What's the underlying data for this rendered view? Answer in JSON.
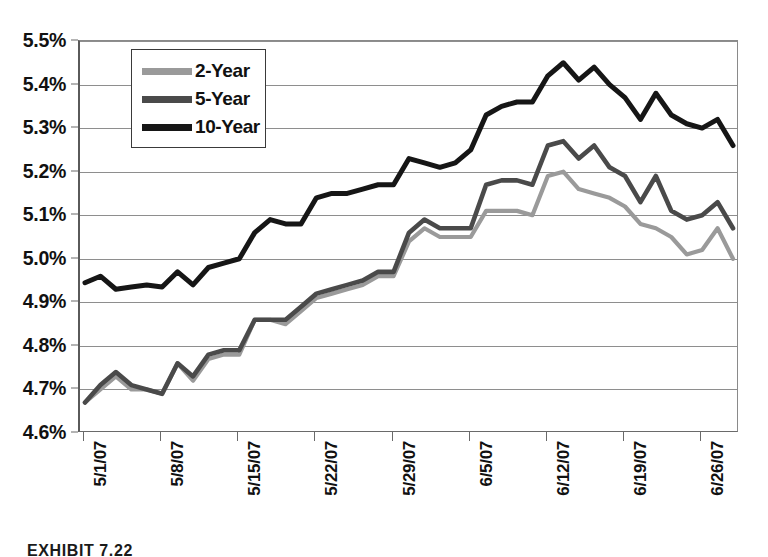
{
  "caption": "EXHIBIT 7.22",
  "colors": {
    "two_year": "#9a9a9a",
    "five_year": "#4a4a4a",
    "ten_year": "#161616",
    "gridline": "#8e8e8e",
    "axis": "#6a6a6a",
    "background": "#ffffff"
  },
  "legend": {
    "position": "inside-top-left",
    "items": [
      {
        "label": "2-Year",
        "color": "#9a9a9a"
      },
      {
        "label": "5-Year",
        "color": "#4a4a4a"
      },
      {
        "label": "10-Year",
        "color": "#161616"
      }
    ]
  },
  "chart_data": {
    "type": "line",
    "title": "",
    "subtitle": "",
    "xlabel": "",
    "ylabel": "",
    "grid": true,
    "ylim": [
      4.6,
      5.5
    ],
    "ytick_labels": [
      "5.5%",
      "5.4%",
      "5.3%",
      "5.2%",
      "5.1%",
      "5.0%",
      "4.9%",
      "4.8%",
      "4.7%",
      "4.6%"
    ],
    "ytick_values": [
      5.5,
      5.4,
      5.3,
      5.2,
      5.1,
      5.0,
      4.9,
      4.8,
      4.7,
      4.6
    ],
    "xtick_labels": [
      "5/1/07",
      "5/8/07",
      "5/15/07",
      "5/22/07",
      "5/29/07",
      "6/5/07",
      "6/12/07",
      "6/19/07",
      "6/26/07"
    ],
    "xtick_indices": [
      0,
      5,
      10,
      15,
      20,
      25,
      30,
      35,
      40
    ],
    "x": [
      0,
      1,
      2,
      3,
      4,
      5,
      6,
      7,
      8,
      9,
      10,
      11,
      12,
      13,
      14,
      15,
      16,
      17,
      18,
      19,
      20,
      21,
      22,
      23,
      24,
      25,
      26,
      27,
      28,
      29,
      30,
      31,
      32,
      33,
      34,
      35,
      36,
      37,
      38,
      39,
      40,
      41,
      42
    ],
    "series": [
      {
        "name": "2-Year",
        "color": "#9a9a9a",
        "values": [
          4.67,
          4.7,
          4.73,
          4.7,
          4.7,
          4.69,
          4.76,
          4.72,
          4.77,
          4.78,
          4.78,
          4.86,
          4.86,
          4.85,
          4.88,
          4.91,
          4.92,
          4.93,
          4.94,
          4.96,
          4.96,
          5.04,
          5.07,
          5.05,
          5.05,
          5.05,
          5.11,
          5.11,
          5.11,
          5.1,
          5.19,
          5.2,
          5.16,
          5.15,
          5.14,
          5.12,
          5.08,
          5.07,
          5.05,
          5.01,
          5.02,
          5.07,
          5.0
        ]
      },
      {
        "name": "5-Year",
        "color": "#4a4a4a",
        "values": [
          4.67,
          4.71,
          4.74,
          4.71,
          4.7,
          4.69,
          4.76,
          4.73,
          4.78,
          4.79,
          4.79,
          4.86,
          4.86,
          4.86,
          4.89,
          4.92,
          4.93,
          4.94,
          4.95,
          4.97,
          4.97,
          5.06,
          5.09,
          5.07,
          5.07,
          5.07,
          5.17,
          5.18,
          5.18,
          5.17,
          5.26,
          5.27,
          5.23,
          5.26,
          5.21,
          5.19,
          5.13,
          5.19,
          5.11,
          5.09,
          5.1,
          5.13,
          5.07
        ]
      },
      {
        "name": "10-Year",
        "color": "#161616",
        "values": [
          4.945,
          4.96,
          4.93,
          4.935,
          4.94,
          4.935,
          4.97,
          4.94,
          4.98,
          4.99,
          5.0,
          5.06,
          5.09,
          5.08,
          5.08,
          5.14,
          5.15,
          5.15,
          5.16,
          5.17,
          5.17,
          5.23,
          5.22,
          5.21,
          5.22,
          5.25,
          5.33,
          5.35,
          5.36,
          5.36,
          5.42,
          5.45,
          5.41,
          5.44,
          5.4,
          5.37,
          5.32,
          5.38,
          5.33,
          5.31,
          5.3,
          5.32,
          5.26
        ]
      }
    ]
  }
}
